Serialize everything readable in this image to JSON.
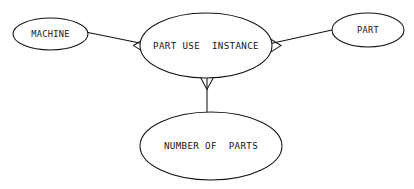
{
  "diagram": {
    "type": "entity-relationship-diagram",
    "background_color": "#ffffff",
    "stroke_color": "#16130f",
    "canvas": {
      "width": 414,
      "height": 189
    },
    "nodes": [
      {
        "id": "machine",
        "label": "MACHINE",
        "shape": "ellipse",
        "cx": 50.5,
        "cy": 34,
        "rx": 37.5,
        "ry": 16
      },
      {
        "id": "part_use_instance",
        "label": "PART USE  INSTANCE",
        "shape": "ellipse",
        "cx": 206,
        "cy": 45.5,
        "rx": 66,
        "ry": 32.5
      },
      {
        "id": "part",
        "label": "PART",
        "shape": "ellipse",
        "cx": 368,
        "cy": 30,
        "rx": 36,
        "ry": 17
      },
      {
        "id": "number_of_parts",
        "label": "NUMBER OF  PARTS",
        "shape": "ellipse",
        "cx": 211,
        "cy": 146,
        "rx": 71,
        "ry": 34
      }
    ],
    "edges": [
      {
        "id": "machine-to-part-use-instance",
        "from": "machine",
        "to": "part_use_instance",
        "arrow_direction": "left",
        "arrow_style": "open-v"
      },
      {
        "id": "part-use-instance-to-part",
        "from": "part_use_instance",
        "to": "part",
        "arrow_direction": "right",
        "arrow_style": "open-v"
      },
      {
        "id": "part-use-instance-to-number-of-parts",
        "from": "part_use_instance",
        "to": "number_of_parts",
        "arrow_direction": "down",
        "arrow_style": "open-v"
      }
    ]
  }
}
